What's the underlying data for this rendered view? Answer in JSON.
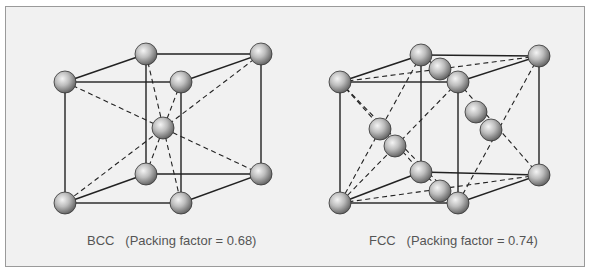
{
  "figure": {
    "bcc": {
      "label": "BCC",
      "caption": "(Packing factor = 0.68)",
      "packing_factor": 0.68
    },
    "fcc": {
      "label": "FCC",
      "caption": "(Packing factor = 0.74)",
      "packing_factor": 0.74
    }
  }
}
